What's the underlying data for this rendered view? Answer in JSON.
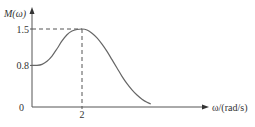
{
  "chart_data": {
    "type": "line",
    "title": "",
    "ylabel": "M(ω)",
    "xlabel": "ω/(rad/s)",
    "ylim": [
      0,
      1.7
    ],
    "xlim": [
      0,
      5.2
    ],
    "grid": false,
    "y_ticks": [
      {
        "value": 0,
        "label": "0"
      },
      {
        "value": 0.8,
        "label": "0.8"
      },
      {
        "value": 1.5,
        "label": "1.5"
      }
    ],
    "x_ticks": [
      {
        "value": 2,
        "label": "2"
      }
    ],
    "series": [
      {
        "name": "M(ω)",
        "x": [
          0,
          0.2,
          0.4,
          0.6,
          0.8,
          1.0,
          1.2,
          1.4,
          1.6,
          1.8,
          2.0,
          2.2,
          2.4,
          2.6,
          2.8,
          3.0,
          3.2,
          3.4,
          3.6,
          3.8,
          4.0,
          4.2,
          4.4,
          4.6,
          4.75
        ],
        "values": [
          0.8,
          0.8,
          0.82,
          0.88,
          0.98,
          1.12,
          1.27,
          1.39,
          1.46,
          1.49,
          1.5,
          1.48,
          1.42,
          1.33,
          1.21,
          1.07,
          0.91,
          0.75,
          0.59,
          0.45,
          0.33,
          0.23,
          0.15,
          0.09,
          0.06
        ]
      }
    ],
    "annotations": [
      {
        "type": "dashed-guide",
        "x": 2,
        "y": 1.5
      }
    ]
  }
}
